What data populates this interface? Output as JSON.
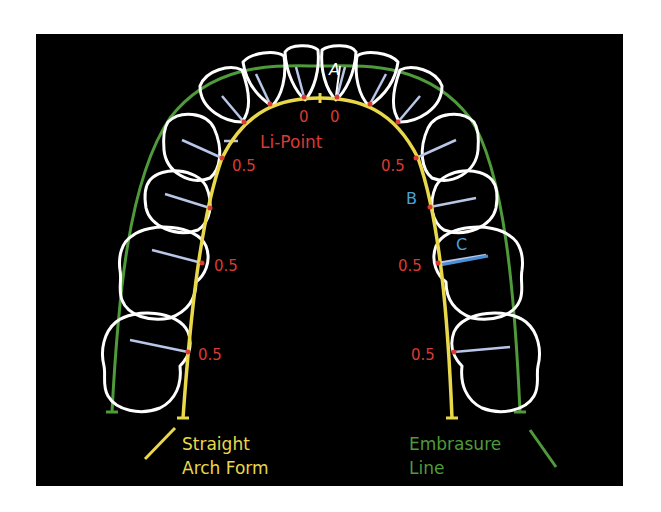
{
  "figure": {
    "type": "dental arch diagram",
    "colors": {
      "background": "#000000",
      "tooth_outline": "#ffffff",
      "arch_form": "#e8d84a",
      "embrasure_line": "#4f9a3a",
      "contact_point": "#d93a33",
      "measurement_line": "#b8c6e8",
      "value_label": "#d93a33",
      "letter_label": "#4aa3d8"
    },
    "point_labels": {
      "a": "A",
      "b": "B",
      "c": "C",
      "li_point": "Li-Point"
    },
    "values": {
      "incisor_left": "0",
      "incisor_right": "0",
      "left": [
        "0.5",
        "0.5",
        "0.5"
      ],
      "right": [
        "0.5",
        "0.5",
        "0.5"
      ]
    },
    "legend": {
      "arch_form_line1": "Straight",
      "arch_form_line2": "Arch Form",
      "embrasure_line1": "Embrasure",
      "embrasure_line2": "Line"
    }
  }
}
